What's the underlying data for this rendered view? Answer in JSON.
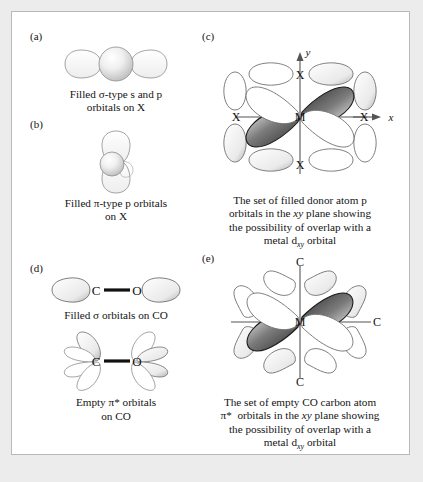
{
  "figure": {
    "background_color": "#ececed",
    "frame_color": "#b9b9bb",
    "panels": [
      {
        "key": "a",
        "label": "(a)",
        "caption_lines": [
          "Filled σ-type s and p",
          "orbitals on X"
        ],
        "atom_labels": [],
        "description": "central s sphere flanked by two horizontal p lobes"
      },
      {
        "key": "b",
        "label": "(b)",
        "caption_lines": [
          "Filled π-type p orbitals",
          "on X"
        ],
        "atom_labels": [],
        "description": "vertical p orbital pair with central sphere"
      },
      {
        "key": "c",
        "label": "(c)",
        "caption_lines": [
          "The set of filled donor atom p",
          "orbitals in the xy plane showing",
          "the possibility of overlap with a",
          "metal d orbital"
        ],
        "axis_labels": {
          "x": "x",
          "y": "y"
        },
        "atom_labels": [
          "X",
          "X",
          "X",
          "X"
        ],
        "center_label": "M",
        "orbital_subscript": "xy",
        "description": "four donor X atoms around metal M with p orbitals in xy plane"
      },
      {
        "key": "d",
        "label": "(d)",
        "caption_lines": [
          "Filled σ orbitals on CO"
        ],
        "caption_lines_2": [
          "Empty π*  orbitals",
          "on CO"
        ],
        "atom_labels": [
          "C",
          "O"
        ],
        "description": "CO molecule with sigma lobes, and below with pi-star lobes"
      },
      {
        "key": "e",
        "label": "(e)",
        "caption_lines": [
          "The set of empty CO carbon atom",
          "π*  orbitals in the xy plane showing",
          "the possibility of overlap with a",
          "metal d orbital"
        ],
        "atom_labels": [
          "C",
          "C",
          "C"
        ],
        "center_label": "M",
        "orbital_subscript": "xy",
        "description": "four CO carbon atoms around metal M with pi-star orbitals in xy plane"
      }
    ],
    "symbols": {
      "sigma": "σ",
      "pi": "π",
      "pi_star": "π*",
      "metal": "M",
      "donor": "X",
      "carbon": "C",
      "oxygen": "O"
    }
  }
}
